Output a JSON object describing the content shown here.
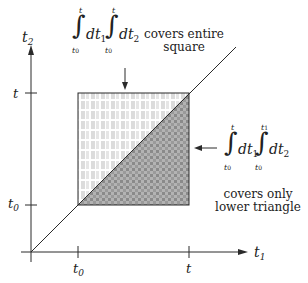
{
  "axes": {
    "x_label": "t",
    "x_label_sub": "1",
    "y_label": "t",
    "y_label_sub": "2",
    "x_ticks": [
      {
        "label": "t",
        "sub": "0"
      },
      {
        "label": "t",
        "sub": ""
      }
    ],
    "y_ticks": [
      {
        "label": "t",
        "sub": ""
      },
      {
        "label": "t",
        "sub": "0"
      }
    ]
  },
  "top_annotation": {
    "integral1": {
      "upper": "t",
      "lower": "t",
      "lower_sub": "0",
      "differential": "dt",
      "diff_sub": "1"
    },
    "integral2": {
      "upper": "t",
      "lower": "t",
      "lower_sub": "0",
      "differential": "dt",
      "diff_sub": "2"
    },
    "caption_line1": "covers entire",
    "caption_line2": "square"
  },
  "right_annotation": {
    "integral1": {
      "upper": "t",
      "lower": "t",
      "lower_sub": "0",
      "differential": "dt",
      "diff_sub": "1"
    },
    "integral2": {
      "upper": "t",
      "upper_sub": "1",
      "lower": "t",
      "lower_sub": "0",
      "differential": "dt",
      "diff_sub": "2"
    },
    "caption_line1": "covers only",
    "caption_line2": "lower triangle"
  },
  "colors": {
    "line": "#2a2a2a",
    "light_fill": "#d9d9d9",
    "dark_fill": "#8f8f8f"
  }
}
